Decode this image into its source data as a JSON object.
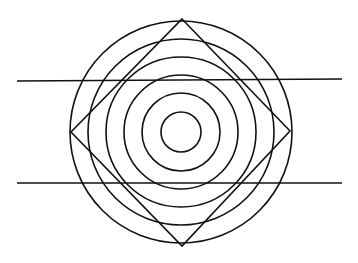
{
  "diagram": {
    "title": "",
    "type": "geometric optical illusion",
    "stroke_color": "#111111",
    "background_color": "#ffffff",
    "concentric_circle_count": 6,
    "diamond_count": 1,
    "horizontal_line_count": 2
  }
}
